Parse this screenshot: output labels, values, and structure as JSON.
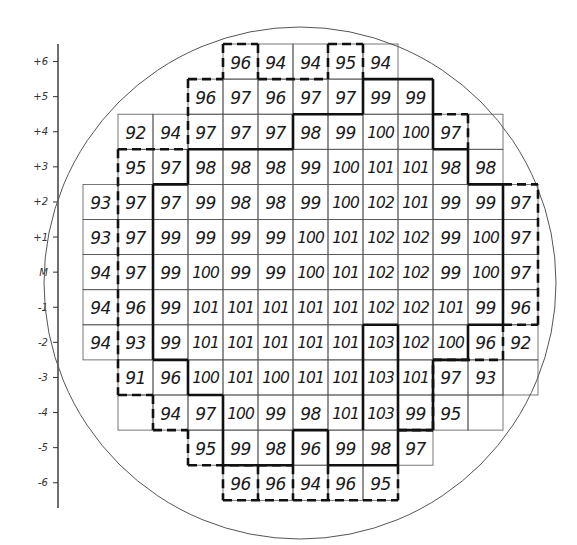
{
  "chart_data": {
    "type": "table",
    "title": "",
    "y_axis": {
      "labels": [
        "+6",
        "+5",
        "+4",
        "+3",
        "+2",
        "+1",
        "M",
        "-1",
        "-2",
        "-3",
        "-4",
        "-5",
        "-6"
      ]
    },
    "columns": 13,
    "rows": [
      {
        "label": "+6",
        "cells": [
          null,
          null,
          null,
          null,
          96,
          94,
          94,
          95,
          94,
          null,
          null,
          null,
          null
        ]
      },
      {
        "label": "+5",
        "cells": [
          null,
          null,
          null,
          96,
          97,
          96,
          97,
          97,
          99,
          99,
          null,
          null,
          null
        ]
      },
      {
        "label": "+4",
        "cells": [
          null,
          92,
          94,
          97,
          97,
          97,
          98,
          99,
          100,
          100,
          97,
          "",
          null
        ]
      },
      {
        "label": "+3",
        "cells": [
          null,
          95,
          97,
          98,
          98,
          98,
          99,
          100,
          101,
          101,
          98,
          98,
          null
        ]
      },
      {
        "label": "+2",
        "cells": [
          93,
          97,
          97,
          99,
          98,
          98,
          99,
          100,
          102,
          101,
          99,
          99,
          97
        ]
      },
      {
        "label": "+1",
        "cells": [
          93,
          97,
          99,
          99,
          99,
          99,
          100,
          101,
          102,
          102,
          99,
          100,
          97
        ]
      },
      {
        "label": "M",
        "cells": [
          94,
          97,
          99,
          100,
          99,
          99,
          100,
          101,
          102,
          102,
          99,
          100,
          97
        ]
      },
      {
        "label": "-1",
        "cells": [
          94,
          96,
          99,
          101,
          101,
          101,
          101,
          101,
          102,
          102,
          101,
          99,
          96
        ]
      },
      {
        "label": "-2",
        "cells": [
          94,
          93,
          99,
          101,
          101,
          101,
          101,
          101,
          103,
          102,
          100,
          96,
          92
        ]
      },
      {
        "label": "-3",
        "cells": [
          null,
          91,
          96,
          100,
          101,
          100,
          101,
          101,
          103,
          101,
          97,
          93,
          ""
        ]
      },
      {
        "label": "-4",
        "cells": [
          null,
          "",
          94,
          97,
          100,
          99,
          98,
          101,
          103,
          99,
          95,
          "",
          null
        ]
      },
      {
        "label": "-5",
        "cells": [
          null,
          null,
          null,
          95,
          99,
          98,
          96,
          99,
          98,
          97,
          null,
          null,
          null
        ]
      },
      {
        "label": "-6",
        "cells": [
          null,
          null,
          null,
          null,
          96,
          96,
          94,
          96,
          95,
          null,
          null,
          null,
          null
        ]
      }
    ]
  }
}
